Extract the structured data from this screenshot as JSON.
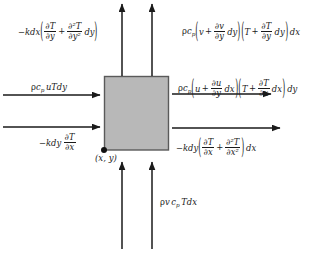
{
  "figure": {
    "type": "control-volume-energy-balance-diagram",
    "background_color": "#ffffff",
    "element_fill_color": "#b8b8b8",
    "element_stroke_color": "#5a5a5a",
    "arrow_color": "#1a1a1a",
    "control_volume": {
      "label": "(x, y)",
      "corner_marker": "corner-dot",
      "x": 104,
      "y": 76,
      "width": 64,
      "height": 74
    },
    "flux_labels": {
      "top_left": {
        "name": "conduction-out-top",
        "text": "−kdx ( ∂T/∂y + ∂²T/∂y² dy )",
        "parts": {
          "prefix": "−kdx",
          "term1_num": "∂T",
          "term1_den": "∂y",
          "operator": "+",
          "term2_num": "∂²T",
          "term2_den": "∂y²",
          "term2_suffix": "dy"
        }
      },
      "top_right": {
        "name": "convection-out-top",
        "text": "ρc_p ( v + ∂v/∂y dy )( T + ∂T/∂y dy ) dx",
        "parts": {
          "prefix_rho": "ρ",
          "prefix_c": "c",
          "prefix_sub": "p",
          "g1_v": "v",
          "g1_op": "+",
          "g1_num": "∂v",
          "g1_den": "∂y",
          "g1_suffix": "dy",
          "g2_T": "T",
          "g2_op": "+",
          "g2_num": "∂T",
          "g2_den": "∂y",
          "g2_suffix": "dy",
          "suffix": "dx"
        }
      },
      "left_upper": {
        "name": "convection-in-left",
        "text": "ρc_p uTdy",
        "parts": {
          "rho": "ρ",
          "c": "c",
          "sub": "p",
          "rest": "uTdy"
        }
      },
      "left_lower": {
        "name": "conduction-in-left",
        "text": "−kdy ∂T/∂x",
        "parts": {
          "prefix": "−kdy",
          "num": "∂T",
          "den": "∂x"
        }
      },
      "right_upper": {
        "name": "convection-out-right",
        "text": "ρc_p ( u + ∂u/∂y dx )( T + ∂T/∂x dx ) dy",
        "parts": {
          "prefix_rho": "ρ",
          "prefix_c": "c",
          "prefix_sub": "p",
          "g1_u": "u",
          "g1_op": "+",
          "g1_num": "∂u",
          "g1_den": "∂y",
          "g1_suffix": "dx",
          "g2_T": "T",
          "g2_op": "+",
          "g2_num": "∂T",
          "g2_den": "∂x",
          "g2_suffix": "dx",
          "suffix": "dy"
        }
      },
      "right_lower": {
        "name": "conduction-out-right",
        "text": "−kdy ( ∂T/∂x + ∂²T/∂x² ) dx",
        "parts": {
          "prefix": "−kdy",
          "term1_num": "∂T",
          "term1_den": "∂x",
          "operator": "+",
          "term2_num": "∂²T",
          "term2_den": "∂x²",
          "suffix": "dx"
        }
      },
      "bottom": {
        "name": "convection-in-bottom",
        "text": "ρv c_p Tdx",
        "parts": {
          "rho": "ρ",
          "v": "v",
          "c": "c",
          "sub": "p",
          "rest": "Tdx"
        }
      }
    },
    "arrows": [
      {
        "name": "arrow-top-left-out",
        "direction": "up",
        "x1": 122,
        "y1": 76,
        "x2": 122,
        "y2": 3
      },
      {
        "name": "arrow-top-right-out",
        "direction": "up",
        "x1": 152,
        "y1": 76,
        "x2": 152,
        "y2": 3
      },
      {
        "name": "arrow-left-upper-in",
        "direction": "right",
        "x1": 3,
        "y1": 95,
        "x2": 101,
        "y2": 95
      },
      {
        "name": "arrow-left-lower-in",
        "direction": "right",
        "x1": 3,
        "y1": 127,
        "x2": 101,
        "y2": 127
      },
      {
        "name": "arrow-right-upper-out",
        "direction": "right",
        "x1": 172,
        "y1": 94,
        "x2": 272,
        "y2": 94
      },
      {
        "name": "arrow-right-lower-out",
        "direction": "right",
        "x1": 172,
        "y1": 128,
        "x2": 281,
        "y2": 128
      },
      {
        "name": "arrow-bottom-left-in",
        "direction": "up",
        "x1": 122,
        "y1": 249,
        "x2": 122,
        "y2": 161
      },
      {
        "name": "arrow-bottom-right-in",
        "direction": "up",
        "x1": 152,
        "y1": 249,
        "x2": 152,
        "y2": 161
      }
    ]
  }
}
